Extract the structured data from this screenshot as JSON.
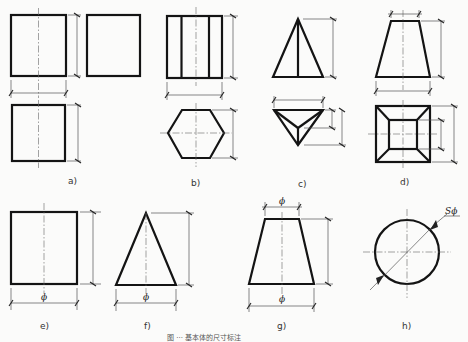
{
  "figure": {
    "panels": [
      {
        "id": "a",
        "label": "a)",
        "shape": "cube / square prism (three views)"
      },
      {
        "id": "b",
        "label": "b)",
        "shape": "hexagonal prism"
      },
      {
        "id": "c",
        "label": "c)",
        "shape": "triangular pyramid"
      },
      {
        "id": "d",
        "label": "d)",
        "shape": "frustum of square pyramid"
      },
      {
        "id": "e",
        "label": "e)",
        "shape": "cylinder",
        "dim_symbol": "ϕ"
      },
      {
        "id": "f",
        "label": "f)",
        "shape": "cone",
        "dim_symbol": "ϕ"
      },
      {
        "id": "g",
        "label": "g)",
        "shape": "frustum of cone",
        "dim_symbol_top": "ϕ",
        "dim_symbol_bottom": "ϕ"
      },
      {
        "id": "h",
        "label": "h)",
        "shape": "sphere",
        "dim_symbol": "Sϕ"
      }
    ],
    "caption": "图 ··· 基本体的尺寸标注",
    "colors": {
      "outline": "#141414",
      "dimension": "#555555",
      "background": "#fbfbfa"
    }
  }
}
